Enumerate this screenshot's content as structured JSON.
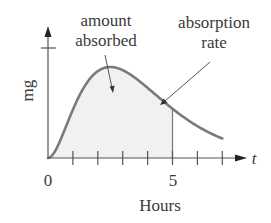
{
  "chart_data": {
    "type": "area",
    "title": "",
    "xlabel": "Hours",
    "ylabel": "mg",
    "x_axis_symbol": "t",
    "x_tick_labels": [
      {
        "value": 0,
        "label": "0"
      },
      {
        "value": 5,
        "label": "5"
      }
    ],
    "x_ticks": [
      1,
      2,
      3,
      4,
      5,
      6,
      7
    ],
    "y_ticks": [
      "unlabeled tick"
    ],
    "xlim": [
      0,
      7.9
    ],
    "grid": false,
    "legend": null,
    "series": [
      {
        "name": "amount absorbed (concentration curve, shaded area under curve 0–5 h)",
        "x": [
          0,
          0.5,
          1,
          1.5,
          2,
          2.5,
          3,
          3.5,
          4,
          4.5,
          5,
          5.5,
          6,
          6.5,
          7
        ],
        "values": [
          0,
          0.25,
          0.53,
          0.77,
          0.93,
          1.0,
          0.97,
          0.89,
          0.77,
          0.65,
          0.54,
          0.43,
          0.34,
          0.27,
          0.21
        ]
      }
    ],
    "shaded_region": {
      "from": 0,
      "to": 5
    },
    "vertical_marker_at": 5,
    "annotations": [
      {
        "text": "amount absorbed",
        "points_to": "shaded area under curve"
      },
      {
        "text": "absorption rate",
        "points_to": "curve"
      }
    ]
  },
  "labels": {
    "annotation_amount_line1": "amount",
    "annotation_amount_line2": "absorbed",
    "annotation_rate_line1": "absorption",
    "annotation_rate_line2": "rate",
    "y_axis": "mg",
    "x_axis_symbol": "t",
    "x_tick_0": "0",
    "x_tick_5": "5",
    "x_axis_title": "Hours"
  },
  "colors": {
    "curve": "#7a7a7a",
    "axis": "#555555",
    "shade": "#f1f1f1",
    "text": "#3a3a3a"
  }
}
